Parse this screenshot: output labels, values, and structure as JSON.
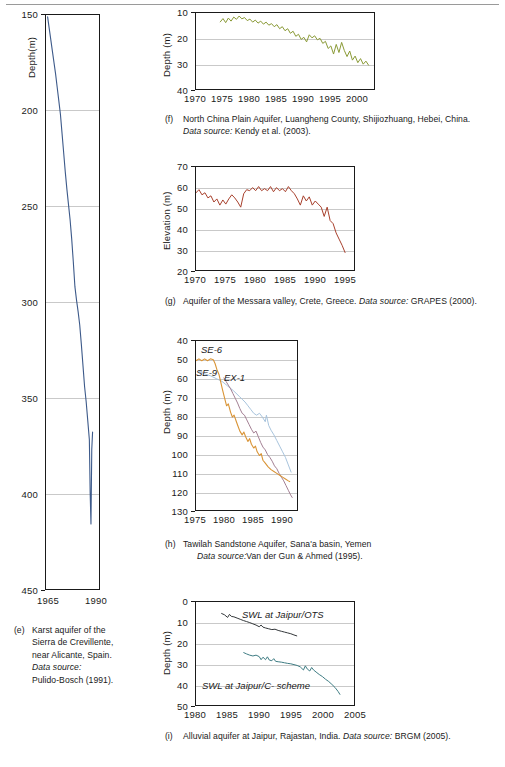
{
  "figure": {
    "note": "Groundwater level time-series panels (e)-(i)"
  },
  "panels": {
    "e": {
      "marker": "(e)",
      "caption_lines": [
        "Karst aquifer of the",
        "Sierra de Crevillente,",
        "near Alicante, Spain."
      ],
      "source_label": "Data source:",
      "source_value": "Pulido-Bosch (1991).",
      "line_color": "#3d5a8a"
    },
    "f": {
      "marker": "(f)",
      "caption": "North China Plain Aquifer, Luangheng County, Shijiozhuang, Hebei, China.",
      "source_label": "Data source:",
      "source_value": "Kendy et al. (2003).",
      "line_color": "#8a9a36"
    },
    "g": {
      "marker": "(g)",
      "caption_pre": "Aquifer of the Messara valley, Crete, Greece.",
      "source_label": "Data source:",
      "source_value": "GRAPES (2000).",
      "line_color": "#a8402c"
    },
    "h": {
      "marker": "(h)",
      "caption": "Tawilah Sandstone Aquifer, Sana'a basin, Yemen",
      "source_label": "Data source:",
      "source_value": "Van der Gun & Ahmed (1995).",
      "series_labels": [
        "SE-6",
        "SE-9",
        "EX-1"
      ],
      "colors": [
        "#d99436",
        "#a8c4dd",
        "#a37f93"
      ]
    },
    "i": {
      "marker": "(i)",
      "caption_pre": "Alluvial aquifer at Jaipur, Rajastan, India.",
      "source_label": "Data source:",
      "source_value": "BRGM (2005).",
      "series_labels": [
        "SWL at Jaipur/OTS",
        "SWL at Jaipur/C- scheme"
      ],
      "colors": [
        "#33373a",
        "#3e7c83"
      ]
    }
  },
  "chart_data": [
    {
      "id": "e",
      "type": "line",
      "title": "Karst aquifer of the Sierra de Crevillente, near Alicante, Spain",
      "xlabel": "",
      "ylabel": "Depth(m)",
      "ylim": [
        150,
        450
      ],
      "yticks": [
        150,
        200,
        250,
        300,
        350,
        400,
        450
      ],
      "ylabels": [
        "150",
        "200",
        "250",
        "300",
        "350",
        "400",
        "450"
      ],
      "y_inverted": true,
      "xlim": [
        1963,
        1996
      ],
      "xticks": [
        1965,
        1990
      ],
      "xlabels": [
        "1965",
        "1990"
      ],
      "grid": true,
      "legend": "none",
      "series": [
        {
          "name": "water level",
          "color": "#3d5a8a",
          "x": [
            1964.0,
            1965.0,
            1966.0,
            1967.0,
            1968.0,
            1969.0,
            1970.0,
            1971.0,
            1972.0,
            1973.0,
            1974.0,
            1975.0,
            1976.0,
            1977.0,
            1978.0,
            1979.0,
            1980.0,
            1981.0,
            1982.0,
            1983.0,
            1984.0,
            1985.0,
            1986.0,
            1987.0,
            1988.0,
            1989.0,
            1990.0,
            1990.5,
            1991.0,
            1991.5,
            1992.0
          ],
          "values": [
            151,
            157,
            163,
            169,
            175,
            181,
            188,
            195,
            202,
            212,
            222,
            232,
            241,
            249,
            257,
            267,
            279,
            292,
            299,
            305,
            312,
            322,
            333,
            344,
            352,
            362,
            372,
            400,
            416,
            377,
            368
          ]
        }
      ]
    },
    {
      "id": "f",
      "type": "line",
      "title": "North China Plain Aquifer, Luangheng County, Shijiozhuang, Hebei, China",
      "xlabel": "",
      "ylabel": "Depth (m)",
      "ylim": [
        10,
        40
      ],
      "yticks": [
        10,
        20,
        30,
        40
      ],
      "ylabels": [
        "10",
        "20",
        "30",
        "40"
      ],
      "y_inverted": true,
      "xlim": [
        1970,
        2003
      ],
      "xticks": [
        1970,
        1975,
        1980,
        1985,
        1990,
        1995,
        2000
      ],
      "xlabels": [
        "1970",
        "1975",
        "1980",
        "1985",
        "1990",
        "1995",
        "2000"
      ],
      "grid": true,
      "legend": "none",
      "series": [
        {
          "name": "depth to water",
          "color": "#8a9a36",
          "x": [
            1974.5,
            1975.0,
            1975.5,
            1976.0,
            1976.5,
            1977.0,
            1977.5,
            1978.0,
            1978.5,
            1979.0,
            1979.5,
            1980.0,
            1980.5,
            1981.0,
            1981.5,
            1982.0,
            1982.5,
            1983.0,
            1983.5,
            1984.0,
            1984.5,
            1985.0,
            1985.5,
            1986.0,
            1986.5,
            1987.0,
            1987.5,
            1988.0,
            1988.5,
            1989.0,
            1989.5,
            1990.0,
            1990.5,
            1991.0,
            1991.5,
            1992.0,
            1992.5,
            1993.0,
            1993.5,
            1994.0,
            1994.5,
            1995.0,
            1995.5,
            1996.0,
            1996.5,
            1997.0,
            1997.5,
            1998.0,
            1998.5,
            1999.0,
            1999.5,
            2000.0,
            2000.5,
            2001.0,
            2001.5,
            2002.0
          ],
          "values": [
            13.5,
            12.2,
            13.8,
            12.0,
            13.2,
            11.6,
            12.5,
            11.2,
            12.3,
            11.8,
            13.0,
            12.4,
            13.6,
            12.8,
            14.0,
            13.2,
            14.4,
            13.6,
            14.8,
            14.2,
            15.4,
            14.6,
            16.2,
            15.4,
            17.0,
            16.2,
            18.0,
            17.2,
            19.2,
            18.4,
            20.4,
            19.6,
            21.4,
            18.6,
            19.8,
            19.0,
            20.6,
            20.0,
            22.0,
            21.2,
            24.0,
            23.0,
            26.2,
            22.4,
            25.6,
            21.6,
            24.8,
            27.2,
            25.0,
            28.6,
            27.0,
            29.6,
            28.0,
            30.2,
            29.0,
            30.6
          ]
        }
      ]
    },
    {
      "id": "g",
      "type": "line",
      "title": "Aquifer of the Messara valley, Crete, Greece",
      "xlabel": "",
      "ylabel": "Elevation (m)",
      "ylim": [
        20,
        70
      ],
      "yticks": [
        20,
        30,
        40,
        50,
        60,
        70
      ],
      "ylabels": [
        "20",
        "30",
        "40",
        "50",
        "60",
        "70"
      ],
      "y_inverted": false,
      "xlim": [
        1970,
        1996.5
      ],
      "xticks": [
        1970,
        1975,
        1980,
        1985,
        1990,
        1995
      ],
      "xlabels": [
        "1970",
        "1975",
        "1980",
        "1985",
        "1990",
        "1995"
      ],
      "grid": true,
      "legend": "none",
      "series": [
        {
          "name": "water table elevation",
          "color": "#a8402c",
          "x": [
            1970.0,
            1970.5,
            1971.0,
            1971.5,
            1972.0,
            1972.5,
            1973.0,
            1973.5,
            1974.0,
            1974.5,
            1975.0,
            1975.5,
            1976.0,
            1976.5,
            1977.0,
            1977.5,
            1978.0,
            1978.5,
            1979.0,
            1979.5,
            1980.0,
            1980.5,
            1981.0,
            1981.5,
            1982.0,
            1982.5,
            1983.0,
            1983.5,
            1984.0,
            1984.5,
            1985.0,
            1985.5,
            1986.0,
            1986.5,
            1987.0,
            1987.5,
            1988.0,
            1988.5,
            1989.0,
            1989.5,
            1990.0,
            1990.5,
            1991.0,
            1991.5,
            1992.0,
            1992.5,
            1993.0,
            1993.5,
            1994.0,
            1994.5,
            1995.0
          ],
          "values": [
            57.5,
            59.0,
            56.5,
            57.5,
            55.0,
            56.0,
            53.0,
            54.5,
            51.5,
            54.0,
            52.0,
            54.5,
            56.5,
            55.0,
            53.0,
            50.5,
            57.0,
            59.0,
            58.5,
            60.0,
            58.5,
            60.5,
            58.5,
            59.5,
            58.5,
            60.5,
            58.0,
            60.0,
            58.5,
            59.5,
            58.0,
            60.5,
            58.5,
            57.0,
            54.5,
            51.5,
            56.0,
            53.5,
            55.5,
            51.5,
            53.5,
            52.0,
            50.5,
            46.0,
            50.5,
            44.0,
            42.5,
            38.0,
            35.0,
            32.0,
            28.5
          ]
        }
      ]
    },
    {
      "id": "h",
      "type": "line",
      "title": "Tawilah Sandstone Aquifer, Sana'a basin, Yemen",
      "xlabel": "",
      "ylabel": "Depth (m)",
      "ylim": [
        40,
        130
      ],
      "yticks": [
        40,
        50,
        60,
        70,
        80,
        90,
        100,
        110,
        120,
        130
      ],
      "ylabels": [
        "40",
        "50",
        "60",
        "70",
        "80",
        "90",
        "100",
        "110",
        "120",
        "130"
      ],
      "y_inverted": true,
      "xlim": [
        1975,
        1992.5
      ],
      "xticks": [
        1975,
        1980,
        1985,
        1990
      ],
      "xlabels": [
        "1975",
        "1980",
        "1985",
        "1990"
      ],
      "grid": true,
      "legend": "inline-annotations",
      "series": [
        {
          "name": "SE-6",
          "color": "#d99436",
          "x": [
            1975.0,
            1975.5,
            1976.0,
            1976.5,
            1977.0,
            1977.5,
            1978.0,
            1978.3,
            1978.6,
            1979.0,
            1979.3,
            1979.6,
            1980.0,
            1980.3,
            1980.6,
            1981.0,
            1981.3,
            1981.6,
            1982.0,
            1982.3,
            1982.6,
            1983.0,
            1983.3,
            1983.6,
            1984.0,
            1984.3,
            1984.6,
            1985.0,
            1985.3,
            1985.6,
            1986.0,
            1986.3,
            1986.6,
            1987.0,
            1987.5,
            1988.0,
            1988.5,
            1989.0,
            1989.5,
            1990.0,
            1990.5,
            1991.0,
            1991.3
          ],
          "values": [
            50.5,
            49.5,
            50.5,
            49.5,
            50.5,
            49.5,
            50.0,
            52.0,
            55.0,
            58.0,
            62.0,
            66.0,
            71.0,
            74.5,
            73.5,
            78.0,
            80.5,
            79.5,
            83.0,
            85.5,
            88.0,
            90.0,
            88.5,
            91.0,
            93.5,
            92.0,
            95.0,
            97.0,
            96.0,
            99.0,
            101.0,
            100.0,
            103.5,
            105.0,
            107.0,
            108.5,
            109.5,
            110.5,
            111.5,
            112.5,
            113.5,
            114.5,
            115.0
          ]
        },
        {
          "name": "SE-9",
          "color": "#a8c4dd",
          "x": [
            1975.5,
            1976.5,
            1977.5,
            1978.5,
            1979.5,
            1980.5,
            1981.5,
            1982.5,
            1983.0,
            1983.5,
            1984.0,
            1984.5,
            1985.0,
            1985.5,
            1986.0,
            1986.5,
            1987.0,
            1987.2,
            1987.6,
            1988.0,
            1988.5,
            1989.0,
            1989.5,
            1990.0,
            1990.5,
            1991.0,
            1991.5
          ],
          "values": [
            56.0,
            57.5,
            58.5,
            60.0,
            61.5,
            64.0,
            66.5,
            69.5,
            71.0,
            72.5,
            74.5,
            76.5,
            78.5,
            79.5,
            78.5,
            80.5,
            83.0,
            79.5,
            85.0,
            87.5,
            90.0,
            93.0,
            96.0,
            99.0,
            102.0,
            106.0,
            110.0
          ]
        },
        {
          "name": "EX-1",
          "color": "#a37f93",
          "x": [
            1979.8,
            1980.2,
            1980.6,
            1981.0,
            1981.4,
            1981.8,
            1982.2,
            1982.6,
            1983.0,
            1983.4,
            1983.8,
            1984.2,
            1984.6,
            1985.0,
            1985.4,
            1985.8,
            1986.2,
            1986.6,
            1987.0,
            1987.4,
            1987.8,
            1988.2,
            1988.6,
            1989.0,
            1989.4,
            1989.8,
            1990.2,
            1990.6,
            1991.0,
            1991.4,
            1991.7
          ],
          "values": [
            59.5,
            61.5,
            63.5,
            65.5,
            68.0,
            70.5,
            73.0,
            76.0,
            78.5,
            79.5,
            82.0,
            84.5,
            87.0,
            89.0,
            88.0,
            91.0,
            94.0,
            96.5,
            98.0,
            100.5,
            102.0,
            104.0,
            106.5,
            108.0,
            110.5,
            112.5,
            114.5,
            117.0,
            119.5,
            122.0,
            123.5
          ]
        }
      ]
    },
    {
      "id": "i",
      "type": "line",
      "title": "Alluvial aquifer at Jaipur, Rajastan, India",
      "xlabel": "",
      "ylabel": "Depth (m)",
      "ylim": [
        0,
        50
      ],
      "yticks": [
        0,
        10,
        20,
        30,
        40,
        50
      ],
      "ylabels": [
        "0",
        "10",
        "20",
        "30",
        "40",
        "50"
      ],
      "y_inverted": true,
      "xlim": [
        1980,
        2005
      ],
      "xticks": [
        1980,
        1985,
        1990,
        1995,
        2000,
        2005
      ],
      "xlabels": [
        "1980",
        "1985",
        "1990",
        "1995",
        "2000",
        "2005"
      ],
      "grid": true,
      "legend": "inline-annotations",
      "series": [
        {
          "name": "SWL at Jaipur/OTS",
          "color": "#33373a",
          "x": [
            1984.0,
            1984.5,
            1985.0,
            1985.3,
            1985.6,
            1986.0,
            1986.5,
            1987.0,
            1987.5,
            1988.0,
            1988.5,
            1989.0,
            1989.5,
            1990.0,
            1990.3,
            1990.6,
            1991.0,
            1991.5,
            1992.0,
            1992.5,
            1993.0,
            1993.5,
            1994.0,
            1994.5,
            1995.0,
            1995.5,
            1996.0
          ],
          "values": [
            5.5,
            6.2,
            7.5,
            6.0,
            7.0,
            7.2,
            7.8,
            8.4,
            9.0,
            9.5,
            10.0,
            10.6,
            11.2,
            12.0,
            11.2,
            12.2,
            12.6,
            13.0,
            13.4,
            13.2,
            13.8,
            14.2,
            14.6,
            15.0,
            15.4,
            16.0,
            16.5
          ]
        },
        {
          "name": "SWL at Jaipur/C- scheme",
          "color": "#3e7c83",
          "x": [
            1987.5,
            1988.0,
            1988.5,
            1989.0,
            1989.5,
            1990.0,
            1990.3,
            1990.6,
            1991.0,
            1991.3,
            1991.6,
            1992.0,
            1992.3,
            1992.6,
            1993.0,
            1993.5,
            1994.0,
            1994.5,
            1995.0,
            1995.5,
            1996.0,
            1996.5,
            1997.0,
            1997.3,
            1997.6,
            1998.0,
            1998.3,
            1998.6,
            1999.0,
            1999.5,
            2000.0,
            2000.5,
            2001.0,
            2001.5,
            2002.0,
            2002.5,
            2002.8
          ],
          "values": [
            24.5,
            25.2,
            25.8,
            26.2,
            25.8,
            26.5,
            28.0,
            26.8,
            28.0,
            26.6,
            28.2,
            28.5,
            27.5,
            28.8,
            29.0,
            29.2,
            29.5,
            29.8,
            30.0,
            30.4,
            30.8,
            31.5,
            33.0,
            31.0,
            32.5,
            33.5,
            31.8,
            33.0,
            34.0,
            35.2,
            36.2,
            37.5,
            38.6,
            40.0,
            41.5,
            43.5,
            45.0
          ]
        }
      ]
    }
  ]
}
